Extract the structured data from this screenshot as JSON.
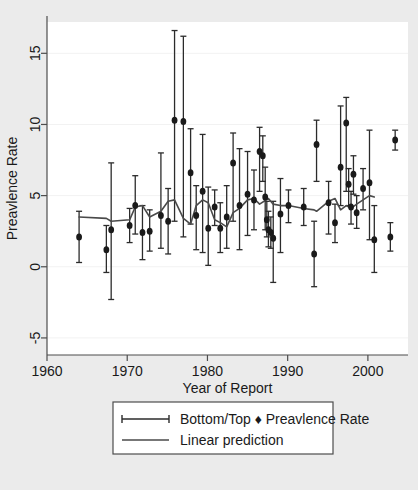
{
  "chart_data": {
    "type": "scatter",
    "title": "",
    "xlabel": "Year of Report",
    "ylabel": "Preavlence Rate",
    "xlim": [
      1960,
      2005
    ],
    "ylim": [
      -6.2,
      17.2
    ],
    "xticks": [
      1960,
      1970,
      1980,
      1990,
      2000
    ],
    "xtick_labels": [
      "1960",
      "1970",
      "1980",
      "1990",
      "2000"
    ],
    "yticks": [
      -5,
      0,
      5,
      10,
      15
    ],
    "ytick_labels": [
      "-5",
      "0",
      "5",
      "10",
      "15"
    ],
    "grid": "horizontal",
    "legend_position": "below-axes",
    "legend": [
      {
        "key": "errorbar-marker",
        "label": "Bottom/Top  ♦  Preavlence Rate"
      },
      {
        "key": "line",
        "label": "Linear prediction"
      }
    ],
    "series": [
      {
        "name": "Preavlence Rate",
        "marker": "filled-circle",
        "error": "Bottom/Top",
        "points": [
          {
            "x": 1964.0,
            "y": 2.1,
            "lo": 0.3,
            "hi": 3.9
          },
          {
            "x": 1967.4,
            "y": 1.2,
            "lo": -0.4,
            "hi": 2.9
          },
          {
            "x": 1968.0,
            "y": 2.6,
            "lo": -2.3,
            "hi": 7.3
          },
          {
            "x": 1970.3,
            "y": 2.9,
            "lo": 1.7,
            "hi": 4.1
          },
          {
            "x": 1971.0,
            "y": 4.3,
            "lo": 2.3,
            "hi": 6.4
          },
          {
            "x": 1971.9,
            "y": 2.4,
            "lo": 0.5,
            "hi": 4.3
          },
          {
            "x": 1972.8,
            "y": 2.5,
            "lo": 1.1,
            "hi": 4.0
          },
          {
            "x": 1974.2,
            "y": 3.6,
            "lo": 1.3,
            "hi": 8.0
          },
          {
            "x": 1975.1,
            "y": 3.2,
            "lo": 0.9,
            "hi": 5.5
          },
          {
            "x": 1975.9,
            "y": 10.3,
            "lo": 3.2,
            "hi": 16.6
          },
          {
            "x": 1977.0,
            "y": 10.2,
            "lo": 2.1,
            "hi": 16.2
          },
          {
            "x": 1977.9,
            "y": 6.6,
            "lo": 3.0,
            "hi": 9.7
          },
          {
            "x": 1978.6,
            "y": 3.6,
            "lo": 1.2,
            "hi": 5.7
          },
          {
            "x": 1979.4,
            "y": 5.3,
            "lo": 1.0,
            "hi": 9.3
          },
          {
            "x": 1980.1,
            "y": 2.7,
            "lo": 0.1,
            "hi": 5.6
          },
          {
            "x": 1980.9,
            "y": 4.2,
            "lo": 2.9,
            "hi": 5.4
          },
          {
            "x": 1981.6,
            "y": 2.7,
            "lo": 1.0,
            "hi": 4.5
          },
          {
            "x": 1982.4,
            "y": 3.5,
            "lo": 1.3,
            "hi": 5.7
          },
          {
            "x": 1983.2,
            "y": 7.3,
            "lo": 3.2,
            "hi": 9.4
          },
          {
            "x": 1984.0,
            "y": 4.3,
            "lo": 1.2,
            "hi": 8.3
          },
          {
            "x": 1985.0,
            "y": 5.1,
            "lo": 2.2,
            "hi": 8.1
          },
          {
            "x": 1985.8,
            "y": 4.7,
            "lo": 2.6,
            "hi": 6.8
          },
          {
            "x": 1986.5,
            "y": 8.1,
            "lo": 5.3,
            "hi": 9.8
          },
          {
            "x": 1986.9,
            "y": 7.8,
            "lo": 6.0,
            "hi": 9.2
          },
          {
            "x": 1987.2,
            "y": 4.9,
            "lo": 2.6,
            "hi": 7.0
          },
          {
            "x": 1987.4,
            "y": 3.3,
            "lo": 2.1,
            "hi": 4.6
          },
          {
            "x": 1987.6,
            "y": 2.6,
            "lo": 1.4,
            "hi": 3.9
          },
          {
            "x": 1987.9,
            "y": 2.4,
            "lo": 1.3,
            "hi": 3.5
          },
          {
            "x": 1988.2,
            "y": 2.0,
            "lo": -1.1,
            "hi": 4.6
          },
          {
            "x": 1989.1,
            "y": 3.7,
            "lo": 1.0,
            "hi": 6.2
          },
          {
            "x": 1990.1,
            "y": 4.3,
            "lo": 3.1,
            "hi": 5.4
          },
          {
            "x": 1992.0,
            "y": 4.2,
            "lo": 2.9,
            "hi": 5.5
          },
          {
            "x": 1993.3,
            "y": 0.9,
            "lo": -1.4,
            "hi": 3.2
          },
          {
            "x": 1993.6,
            "y": 8.6,
            "lo": 6.0,
            "hi": 10.3
          },
          {
            "x": 1995.1,
            "y": 4.5,
            "lo": 2.3,
            "hi": 6.0
          },
          {
            "x": 1995.9,
            "y": 3.1,
            "lo": 1.7,
            "hi": 4.4
          },
          {
            "x": 1996.6,
            "y": 7.0,
            "lo": 4.3,
            "hi": 11.3
          },
          {
            "x": 1997.3,
            "y": 10.1,
            "lo": 5.3,
            "hi": 11.9
          },
          {
            "x": 1997.6,
            "y": 5.8,
            "lo": 4.3,
            "hi": 6.9
          },
          {
            "x": 1997.9,
            "y": 4.2,
            "lo": 3.0,
            "hi": 5.3
          },
          {
            "x": 1998.2,
            "y": 6.5,
            "lo": 5.1,
            "hi": 7.8
          },
          {
            "x": 1998.6,
            "y": 3.8,
            "lo": 2.7,
            "hi": 5.0
          },
          {
            "x": 1999.4,
            "y": 5.5,
            "lo": 4.0,
            "hi": 6.9
          },
          {
            "x": 2000.2,
            "y": 5.9,
            "lo": 1.9,
            "hi": 9.6
          },
          {
            "x": 2000.8,
            "y": 1.9,
            "lo": -0.4,
            "hi": 4.3
          },
          {
            "x": 2002.8,
            "y": 2.1,
            "lo": 1.1,
            "hi": 3.1
          },
          {
            "x": 2003.4,
            "y": 8.9,
            "lo": 8.2,
            "hi": 9.6
          }
        ]
      },
      {
        "name": "Linear prediction",
        "type": "line",
        "points": [
          {
            "x": 1964.0,
            "y": 3.5
          },
          {
            "x": 1967.4,
            "y": 3.4
          },
          {
            "x": 1968.0,
            "y": 3.2
          },
          {
            "x": 1970.3,
            "y": 3.3
          },
          {
            "x": 1971.0,
            "y": 4.2
          },
          {
            "x": 1971.9,
            "y": 4.3
          },
          {
            "x": 1972.8,
            "y": 3.5
          },
          {
            "x": 1974.2,
            "y": 3.9
          },
          {
            "x": 1975.1,
            "y": 4.6
          },
          {
            "x": 1975.9,
            "y": 4.7
          },
          {
            "x": 1977.0,
            "y": 3.4
          },
          {
            "x": 1977.9,
            "y": 3.0
          },
          {
            "x": 1978.6,
            "y": 4.3
          },
          {
            "x": 1979.4,
            "y": 4.7
          },
          {
            "x": 1980.1,
            "y": 4.5
          },
          {
            "x": 1980.9,
            "y": 3.3
          },
          {
            "x": 1981.6,
            "y": 3.1
          },
          {
            "x": 1982.4,
            "y": 2.8
          },
          {
            "x": 1983.2,
            "y": 3.8
          },
          {
            "x": 1984.0,
            "y": 4.1
          },
          {
            "x": 1985.0,
            "y": 4.7
          },
          {
            "x": 1985.8,
            "y": 4.8
          },
          {
            "x": 1986.5,
            "y": 4.4
          },
          {
            "x": 1987.6,
            "y": 4.8
          },
          {
            "x": 1988.2,
            "y": 4.4
          },
          {
            "x": 1989.1,
            "y": 4.3
          },
          {
            "x": 1990.1,
            "y": 4.3
          },
          {
            "x": 1992.0,
            "y": 4.1
          },
          {
            "x": 1993.3,
            "y": 4.0
          },
          {
            "x": 1993.6,
            "y": 3.9
          },
          {
            "x": 1995.1,
            "y": 4.6
          },
          {
            "x": 1995.9,
            "y": 4.8
          },
          {
            "x": 1996.6,
            "y": 4.0
          },
          {
            "x": 1997.3,
            "y": 4.3
          },
          {
            "x": 1997.9,
            "y": 4.1
          },
          {
            "x": 1998.6,
            "y": 4.4
          },
          {
            "x": 1999.4,
            "y": 4.7
          },
          {
            "x": 2000.2,
            "y": 5.0
          },
          {
            "x": 2000.8,
            "y": 4.9
          }
        ]
      }
    ],
    "colors": {
      "background": "#ebebeb",
      "plot_area": "#ffffff",
      "marker": "#1a1a1a",
      "errorbar": "#2b2b2b",
      "line": "#4a4a4a",
      "grid": "#f2f2f2",
      "axis": "#4d4d4d",
      "legend_border": "#4d4d4d",
      "legend_background": "#ffffff"
    }
  }
}
